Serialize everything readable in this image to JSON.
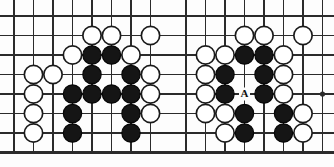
{
  "figure": {
    "type": "go-board-diagram-pair",
    "background_color": "#fdfdfd",
    "line_color": "#2b2b2b",
    "black_stone_color": "#151515",
    "white_stone_color": "#ffffff",
    "label_color": "#111111",
    "width": 334,
    "height": 167
  },
  "boards": [
    {
      "name": "left-board",
      "title": "",
      "origin_x": 0,
      "origin_y": 0,
      "grid": {
        "x_start": 14,
        "y_start": 16,
        "spacing": 19.5,
        "cols": 8,
        "rows": 8,
        "bottom_edge_row": 7,
        "star_points": []
      },
      "stones": [
        {
          "col": 4,
          "row": 1,
          "color": "white"
        },
        {
          "col": 5,
          "row": 1,
          "color": "white"
        },
        {
          "col": 7,
          "row": 1,
          "color": "white"
        },
        {
          "col": 3,
          "row": 2,
          "color": "white"
        },
        {
          "col": 4,
          "row": 2,
          "color": "black"
        },
        {
          "col": 5,
          "row": 2,
          "color": "black"
        },
        {
          "col": 6,
          "row": 2,
          "color": "white"
        },
        {
          "col": 1,
          "row": 3,
          "color": "white"
        },
        {
          "col": 2,
          "row": 3,
          "color": "white"
        },
        {
          "col": 4,
          "row": 3,
          "color": "black"
        },
        {
          "col": 6,
          "row": 3,
          "color": "black"
        },
        {
          "col": 7,
          "row": 3,
          "color": "white"
        },
        {
          "col": 1,
          "row": 4,
          "color": "white"
        },
        {
          "col": 3,
          "row": 4,
          "color": "black"
        },
        {
          "col": 4,
          "row": 4,
          "color": "black"
        },
        {
          "col": 5,
          "row": 4,
          "color": "black"
        },
        {
          "col": 6,
          "row": 4,
          "color": "black"
        },
        {
          "col": 7,
          "row": 4,
          "color": "white"
        },
        {
          "col": 1,
          "row": 5,
          "color": "white"
        },
        {
          "col": 3,
          "row": 5,
          "color": "black"
        },
        {
          "col": 6,
          "row": 5,
          "color": "black"
        },
        {
          "col": 7,
          "row": 5,
          "color": "white"
        },
        {
          "col": 1,
          "row": 6,
          "color": "white"
        },
        {
          "col": 3,
          "row": 6,
          "color": "black"
        },
        {
          "col": 6,
          "row": 6,
          "color": "black"
        }
      ],
      "markers": []
    },
    {
      "name": "right-board",
      "title": "",
      "origin_x": 167,
      "origin_y": 0,
      "grid": {
        "x_start": 19,
        "y_start": 16,
        "spacing": 19.5,
        "cols": 8,
        "rows": 8,
        "bottom_edge_row": 7,
        "star_points": [
          {
            "col": 7,
            "row": 4
          }
        ]
      },
      "stones": [
        {
          "col": 3,
          "row": 1,
          "color": "white"
        },
        {
          "col": 4,
          "row": 1,
          "color": "white"
        },
        {
          "col": 6,
          "row": 1,
          "color": "white"
        },
        {
          "col": 1,
          "row": 2,
          "color": "white"
        },
        {
          "col": 2,
          "row": 2,
          "color": "white"
        },
        {
          "col": 3,
          "row": 2,
          "color": "black"
        },
        {
          "col": 4,
          "row": 2,
          "color": "black"
        },
        {
          "col": 5,
          "row": 2,
          "color": "white"
        },
        {
          "col": 1,
          "row": 3,
          "color": "white"
        },
        {
          "col": 2,
          "row": 3,
          "color": "black"
        },
        {
          "col": 4,
          "row": 3,
          "color": "black"
        },
        {
          "col": 5,
          "row": 3,
          "color": "white"
        },
        {
          "col": 1,
          "row": 4,
          "color": "white"
        },
        {
          "col": 2,
          "row": 4,
          "color": "black"
        },
        {
          "col": 4,
          "row": 4,
          "color": "black"
        },
        {
          "col": 5,
          "row": 4,
          "color": "white"
        },
        {
          "col": 1,
          "row": 5,
          "color": "white"
        },
        {
          "col": 2,
          "row": 5,
          "color": "white"
        },
        {
          "col": 3,
          "row": 5,
          "color": "black"
        },
        {
          "col": 5,
          "row": 5,
          "color": "black"
        },
        {
          "col": 6,
          "row": 5,
          "color": "white"
        },
        {
          "col": 2,
          "row": 6,
          "color": "white"
        },
        {
          "col": 3,
          "row": 6,
          "color": "black"
        },
        {
          "col": 5,
          "row": 6,
          "color": "black"
        },
        {
          "col": 6,
          "row": 6,
          "color": "white"
        }
      ],
      "markers": [
        {
          "col": 3,
          "row": 4,
          "label": "A"
        }
      ]
    }
  ]
}
